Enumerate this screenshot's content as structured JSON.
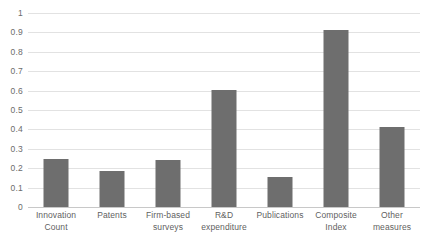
{
  "chart_data": {
    "type": "bar",
    "title": "",
    "subtitle": "",
    "xlabel": "",
    "ylabel": "",
    "ylim": [
      0,
      1
    ],
    "ytick_labels": [
      "1",
      "0.9",
      "0.8",
      "0.7",
      "0.6",
      "0.5",
      "0.4",
      "0.3",
      "0.2",
      "0.1",
      "0"
    ],
    "ytick_values": [
      1,
      0.9,
      0.8,
      0.7,
      0.6,
      0.5,
      0.4,
      0.3,
      0.2,
      0.1,
      0
    ],
    "grid": true,
    "grid_axis": "y",
    "legend": false,
    "legend_position": "none",
    "bar_color": "#6e6e6e",
    "gridline_color": "#e2e2e2",
    "axis_color": "#c8c8c8",
    "categories": [
      "Innovation Count",
      "Patents",
      "Firm-based surveys",
      "R&D expenditure",
      "Publications",
      "Composite Index",
      "Other measures"
    ],
    "category_label_lines": [
      [
        "Innovation",
        "Count"
      ],
      [
        "Patents"
      ],
      [
        "Firm-based",
        "surveys"
      ],
      [
        "R&D",
        "expenditure"
      ],
      [
        "Publications"
      ],
      [
        "Composite",
        "Index"
      ],
      [
        "Other",
        "measures"
      ]
    ],
    "values": [
      0.25,
      0.185,
      0.24,
      0.605,
      0.155,
      0.91,
      0.41
    ]
  }
}
